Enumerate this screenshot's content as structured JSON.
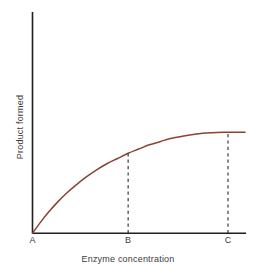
{
  "chart_data": {
    "type": "line",
    "title": "",
    "xlabel": "Enzyme concentration",
    "ylabel": "Product formed",
    "grid": false,
    "legend": null,
    "xlim": [
      0,
      1
    ],
    "ylim": [
      0,
      1
    ],
    "xticks": [
      "A",
      "B",
      "C"
    ],
    "xtick_positions": [
      0.0,
      0.45,
      0.92
    ],
    "yticks": [],
    "series": [
      {
        "name": "Product formed vs enzyme concentration",
        "color": "#8a4331",
        "description": "saturation curve rising steeply from origin A then levelling to a plateau before B and remaining flat through C",
        "x": [
          0.0,
          0.04,
          0.08,
          0.12,
          0.16,
          0.2,
          0.25,
          0.3,
          0.35,
          0.4,
          0.45,
          0.5,
          0.55,
          0.6,
          0.65,
          0.7,
          0.8,
          0.9,
          1.0
        ],
        "y": [
          0.0,
          0.11,
          0.21,
          0.3,
          0.38,
          0.45,
          0.53,
          0.6,
          0.66,
          0.71,
          0.76,
          0.8,
          0.84,
          0.87,
          0.9,
          0.92,
          0.95,
          0.96,
          0.96
        ]
      }
    ],
    "annotations": [
      {
        "name": "dashed-line-b",
        "type": "vertical-dashed-line",
        "x_label": "B",
        "x": 0.45,
        "y_from": 0.0,
        "y_to": 0.76,
        "color": "#2b2b2b"
      },
      {
        "name": "dashed-line-c",
        "type": "vertical-dashed-line",
        "x_label": "C",
        "x": 0.92,
        "y_from": 0.0,
        "y_to": 0.96,
        "color": "#2b2b2b"
      }
    ]
  },
  "axes": {
    "x_title": "Enzyme concentration",
    "y_title": "Product formed",
    "tick_a": "A",
    "tick_b": "B",
    "tick_c": "C",
    "axis_color": "#1f1f1f"
  },
  "colors": {
    "curve": "#8a4331",
    "axis": "#1f1f1f",
    "dashed": "#2b2b2b",
    "text": "#3c3c3c",
    "background": "#ffffff"
  }
}
